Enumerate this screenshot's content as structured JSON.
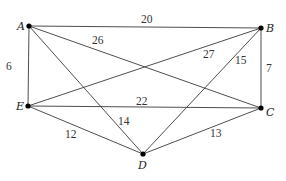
{
  "diagram": {
    "type": "weighted-undirected-graph",
    "vertices": [
      {
        "id": "A",
        "label": "A",
        "x": 29,
        "y": 26,
        "lx": 17,
        "ly": 30
      },
      {
        "id": "B",
        "label": "B",
        "x": 261,
        "y": 28,
        "lx": 266,
        "ly": 32
      },
      {
        "id": "C",
        "label": "C",
        "x": 261,
        "y": 108,
        "lx": 266,
        "ly": 116
      },
      {
        "id": "D",
        "label": "D",
        "x": 143,
        "y": 154,
        "lx": 138,
        "ly": 169
      },
      {
        "id": "E",
        "label": "E",
        "x": 28,
        "y": 106,
        "lx": 16,
        "ly": 110
      }
    ],
    "edges": [
      {
        "from": "A",
        "to": "B",
        "weight": "20",
        "lx": 141,
        "ly": 23
      },
      {
        "from": "A",
        "to": "E",
        "weight": "6",
        "lx": 6,
        "ly": 70
      },
      {
        "from": "A",
        "to": "C",
        "weight": "26",
        "lx": 92,
        "ly": 44
      },
      {
        "from": "A",
        "to": "D",
        "weight": "14",
        "lx": 118,
        "ly": 125
      },
      {
        "from": "B",
        "to": "C",
        "weight": "7",
        "lx": 266,
        "ly": 72
      },
      {
        "from": "B",
        "to": "E",
        "weight": "27",
        "lx": 203,
        "ly": 58
      },
      {
        "from": "B",
        "to": "D",
        "weight": "15",
        "lx": 235,
        "ly": 64
      },
      {
        "from": "E",
        "to": "C",
        "weight": "22",
        "lx": 136,
        "ly": 105
      },
      {
        "from": "E",
        "to": "D",
        "weight": "12",
        "lx": 65,
        "ly": 138
      },
      {
        "from": "D",
        "to": "C",
        "weight": "13",
        "lx": 210,
        "ly": 137
      }
    ]
  }
}
